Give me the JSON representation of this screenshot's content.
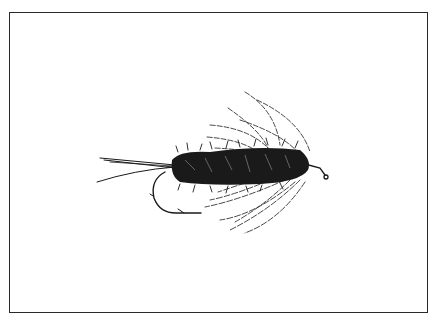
{
  "image": {
    "subject": "fishing fly illustration",
    "style": "black ink line drawing",
    "colors": {
      "background": "#ffffff",
      "ink": "#1a1a1a",
      "frame": "#2a2a2a"
    }
  }
}
